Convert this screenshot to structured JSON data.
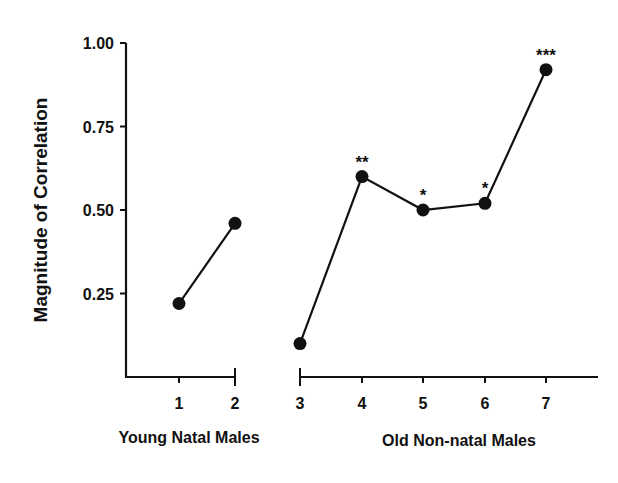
{
  "chart_data": {
    "type": "line",
    "title": "",
    "ylabel": "Magnitude of Correlation",
    "xlabel": "",
    "ylim": [
      0.0,
      1.0
    ],
    "yticks": [
      "1.00",
      "0.75",
      "0.50",
      "0.25"
    ],
    "grid": false,
    "legend": null,
    "groups": [
      {
        "name": "Young Natal Males",
        "x": [
          1,
          2
        ]
      },
      {
        "name": "Old Non-natal Males",
        "x": [
          3,
          4,
          5,
          6,
          7
        ]
      }
    ],
    "series": [
      {
        "name": "Young Natal Males",
        "x": [
          1,
          2
        ],
        "values": [
          0.22,
          0.46
        ],
        "annotations": [
          "",
          ""
        ]
      },
      {
        "name": "Old Non-natal Males",
        "x": [
          3,
          4,
          5,
          6,
          7
        ],
        "values": [
          0.1,
          0.6,
          0.5,
          0.52,
          0.92
        ],
        "annotations": [
          "",
          "**",
          "*",
          "*",
          "***"
        ]
      }
    ],
    "xticks": [
      "1",
      "2",
      "3",
      "4",
      "5",
      "6",
      "7"
    ]
  }
}
